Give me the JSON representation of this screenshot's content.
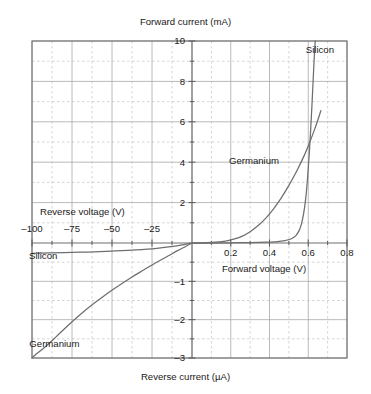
{
  "chart_data": {
    "type": "line",
    "title": "",
    "axis_titles": {
      "top": "Forward current (mA)",
      "bottom": "Reverse current (µA)",
      "left": "Reverse voltage (V)",
      "right": "Forward voltage (V)"
    },
    "quadrants": {
      "forward": {
        "xlabel": "Forward voltage (V)",
        "ylabel": "Forward current (mA)",
        "xlim": [
          0,
          0.8
        ],
        "ylim": [
          0,
          10
        ],
        "xticks": [
          0.2,
          0.4,
          0.6,
          0.8
        ],
        "xtick_labels": [
          "0.2",
          "0.4",
          "0.6",
          "0.8"
        ],
        "yticks": [
          2,
          4,
          6,
          8,
          10
        ],
        "ytick_labels": [
          "2",
          "4",
          "6",
          "8",
          "10"
        ]
      },
      "reverse": {
        "xlabel": "Reverse voltage (V)",
        "ylabel": "Reverse current (µA)",
        "xlim": [
          -100,
          0
        ],
        "ylim": [
          -3,
          0
        ],
        "xticks": [
          -100,
          -75,
          -50,
          -25
        ],
        "xtick_labels": [
          "–100",
          "–75",
          "–50",
          "–25"
        ],
        "yticks": [
          -1,
          -2,
          -3
        ],
        "ytick_labels": [
          "–1",
          "–2",
          "–3"
        ]
      }
    },
    "grid": {
      "major": true,
      "minor": true,
      "major_color": "#a8a8a8",
      "minor_color": "#c9c9c9",
      "minor_style": "dashed"
    },
    "legend": {
      "position": "inline-annotations",
      "entries": [
        "Silicon",
        "Germanium"
      ]
    },
    "annotations": [
      {
        "text": "Silicon",
        "region": "forward",
        "x": 0.66,
        "y": 9.4
      },
      {
        "text": "Germanium",
        "region": "forward",
        "x": 0.32,
        "y": 3.9
      },
      {
        "text": "Silicon",
        "region": "reverse",
        "x": -93,
        "y": -0.42
      },
      {
        "text": "Germanium",
        "region": "reverse",
        "x": -86,
        "y": -2.7
      }
    ],
    "series": [
      {
        "name": "Silicon",
        "color": "#6e6e6e",
        "region": "forward",
        "points": [
          [
            0.0,
            0.0
          ],
          [
            0.1,
            0.0
          ],
          [
            0.2,
            0.01
          ],
          [
            0.3,
            0.02
          ],
          [
            0.38,
            0.04
          ],
          [
            0.44,
            0.07
          ],
          [
            0.48,
            0.12
          ],
          [
            0.51,
            0.2
          ],
          [
            0.535,
            0.35
          ],
          [
            0.552,
            0.6
          ],
          [
            0.565,
            0.95
          ],
          [
            0.576,
            1.45
          ],
          [
            0.585,
            2.05
          ],
          [
            0.593,
            2.8
          ],
          [
            0.6,
            3.7
          ],
          [
            0.607,
            4.7
          ],
          [
            0.613,
            5.7
          ],
          [
            0.619,
            6.8
          ],
          [
            0.625,
            8.0
          ],
          [
            0.631,
            9.2
          ],
          [
            0.636,
            10.0
          ]
        ]
      },
      {
        "name": "Germanium",
        "color": "#6e6e6e",
        "region": "forward",
        "points": [
          [
            0.0,
            0.0
          ],
          [
            0.05,
            0.01
          ],
          [
            0.1,
            0.03
          ],
          [
            0.14,
            0.06
          ],
          [
            0.18,
            0.11
          ],
          [
            0.22,
            0.2
          ],
          [
            0.26,
            0.34
          ],
          [
            0.3,
            0.56
          ],
          [
            0.34,
            0.85
          ],
          [
            0.38,
            1.22
          ],
          [
            0.42,
            1.68
          ],
          [
            0.46,
            2.22
          ],
          [
            0.5,
            2.85
          ],
          [
            0.54,
            3.55
          ],
          [
            0.58,
            4.35
          ],
          [
            0.61,
            5.05
          ],
          [
            0.63,
            5.55
          ],
          [
            0.65,
            6.1
          ],
          [
            0.665,
            6.55
          ]
        ]
      },
      {
        "name": "Silicon",
        "color": "#6e6e6e",
        "region": "reverse",
        "points": [
          [
            0,
            0.0
          ],
          [
            -5,
            -0.04
          ],
          [
            -12,
            -0.09
          ],
          [
            -22,
            -0.14
          ],
          [
            -35,
            -0.18
          ],
          [
            -50,
            -0.21
          ],
          [
            -65,
            -0.235
          ],
          [
            -80,
            -0.25
          ],
          [
            -100,
            -0.27
          ]
        ]
      },
      {
        "name": "Germanium",
        "color": "#6e6e6e",
        "region": "reverse",
        "points": [
          [
            0,
            0.0
          ],
          [
            -4,
            -0.09
          ],
          [
            -9,
            -0.2
          ],
          [
            -15,
            -0.34
          ],
          [
            -22,
            -0.5
          ],
          [
            -30,
            -0.7
          ],
          [
            -38,
            -0.9
          ],
          [
            -46,
            -1.12
          ],
          [
            -54,
            -1.35
          ],
          [
            -62,
            -1.6
          ],
          [
            -70,
            -1.87
          ],
          [
            -78,
            -2.17
          ],
          [
            -85,
            -2.45
          ],
          [
            -92,
            -2.72
          ],
          [
            -98,
            -2.92
          ],
          [
            -100,
            -3.0
          ]
        ]
      }
    ]
  }
}
